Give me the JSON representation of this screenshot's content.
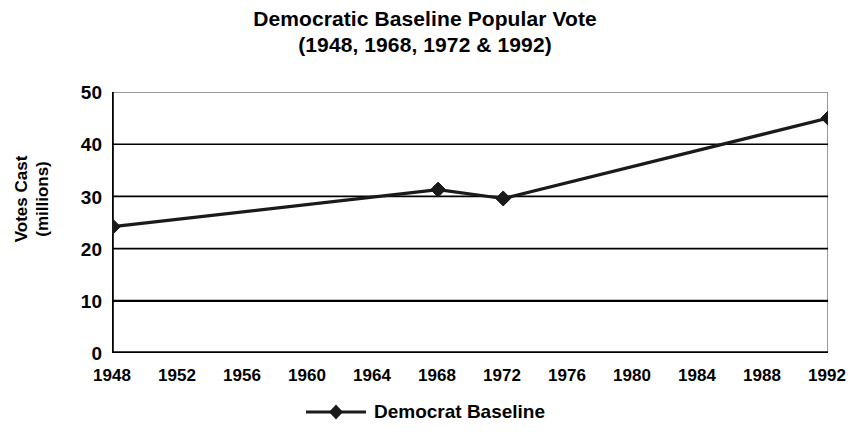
{
  "chart_data": {
    "type": "line",
    "title": "Democratic Baseline Popular Vote (1948, 1968, 1972 & 1992)",
    "title_line1": "Democratic Baseline Popular Vote",
    "title_line2": "(1948, 1968, 1972 & 1992)",
    "xlabel": "",
    "ylabel": "Votes Cast (millions)",
    "ylabel_line1": "Votes Cast",
    "ylabel_line2": "(millions)",
    "x_tick_labels": [
      "1948",
      "1952",
      "1956",
      "1960",
      "1964",
      "1968",
      "1972",
      "1976",
      "1980",
      "1984",
      "1988",
      "1992"
    ],
    "y_tick_labels": [
      "0",
      "10",
      "20",
      "30",
      "40",
      "50"
    ],
    "y_ticks": [
      0,
      10,
      20,
      30,
      40,
      50
    ],
    "ylim": [
      0,
      50
    ],
    "xlim": [
      1948,
      1992
    ],
    "grid": "horizontal",
    "legend_position": "bottom-center",
    "series": [
      {
        "name": "Democrat Baseline",
        "marker": "diamond",
        "color": "#1a1a1a",
        "x": [
          1948,
          1968,
          1972,
          1992
        ],
        "values": [
          24.2,
          31.3,
          29.6,
          45.0
        ]
      }
    ],
    "legend": [
      "Democrat Baseline"
    ]
  },
  "legend": {
    "entry_label": "Democrat Baseline"
  },
  "colors": {
    "series": "#1a1a1a",
    "gridline": "#000000",
    "plot_border": "#9a9a9a",
    "background": "#ffffff"
  }
}
